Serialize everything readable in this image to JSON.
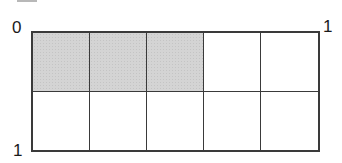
{
  "diagram": {
    "type": "area-model-grid",
    "rows": 2,
    "columns": 5,
    "shaded_cells": [
      [
        0,
        0
      ],
      [
        0,
        1
      ],
      [
        0,
        2
      ]
    ],
    "colors": {
      "shaded": "#d4d4d4",
      "unshaded": "#ffffff",
      "border": "#3a3a3a"
    },
    "labels": {
      "top_left": "0",
      "top_right": "1",
      "bottom_left": "1"
    },
    "cells": [
      {
        "row": 0,
        "col": 0,
        "shaded": true
      },
      {
        "row": 0,
        "col": 1,
        "shaded": true
      },
      {
        "row": 0,
        "col": 2,
        "shaded": true
      },
      {
        "row": 0,
        "col": 3,
        "shaded": false
      },
      {
        "row": 0,
        "col": 4,
        "shaded": false
      },
      {
        "row": 1,
        "col": 0,
        "shaded": false
      },
      {
        "row": 1,
        "col": 1,
        "shaded": false
      },
      {
        "row": 1,
        "col": 2,
        "shaded": false
      },
      {
        "row": 1,
        "col": 3,
        "shaded": false
      },
      {
        "row": 1,
        "col": 4,
        "shaded": false
      }
    ]
  }
}
